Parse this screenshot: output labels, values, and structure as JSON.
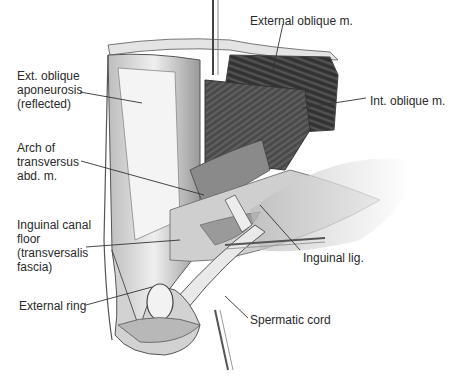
{
  "figure": {
    "labels": [
      {
        "id": "external-oblique-m",
        "text": "External oblique m.",
        "x": 250,
        "y": 14
      },
      {
        "id": "ext-oblique-aponeurosis",
        "text": "Ext. oblique\naponeurosis\n(reflected)",
        "x": 17,
        "y": 69
      },
      {
        "id": "int-oblique-m",
        "text": "Int. oblique m.",
        "x": 370,
        "y": 94
      },
      {
        "id": "arch-of-transversus",
        "text": "Arch of\ntransversus\nabd. m.",
        "x": 17,
        "y": 141
      },
      {
        "id": "inguinal-canal-floor",
        "text": "Inguinal canal\nfloor\n(transversalis\nfascia)",
        "x": 17,
        "y": 218
      },
      {
        "id": "inguinal-lig",
        "text": "Inguinal lig.",
        "x": 303,
        "y": 251
      },
      {
        "id": "external-ring",
        "text": "External ring",
        "x": 19,
        "y": 299
      },
      {
        "id": "spermatic-cord",
        "text": "Spermatic cord",
        "x": 250,
        "y": 313
      }
    ],
    "colors": {
      "text": "#2a2a2a",
      "leader": "#333333",
      "muscle_dark": "#3a3a3a",
      "muscle_mid": "#6e6e6e",
      "fascia_light": "#d9d9d9",
      "background": "#ffffff"
    }
  }
}
